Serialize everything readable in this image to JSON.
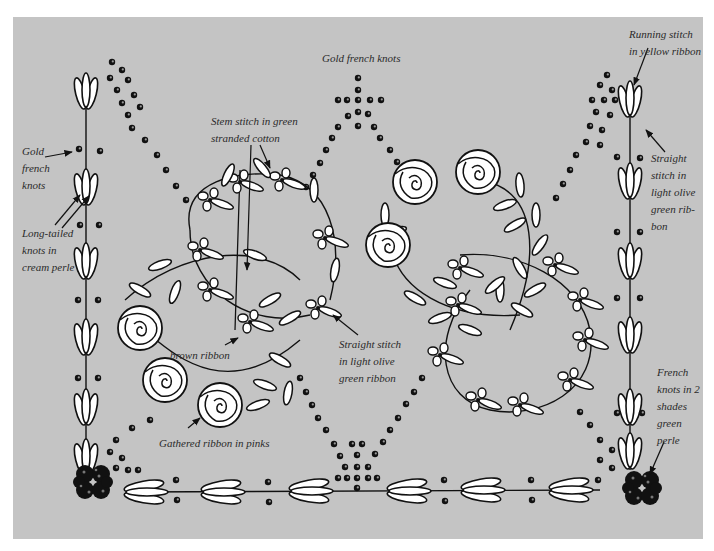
{
  "diagram": {
    "background_color": "#c4c4c4",
    "ink_color": "#111111",
    "fill_color": "#ffffff",
    "labels": {
      "gold_french_knots_left": "Gold\nfrench\nknots",
      "long_tailed_knots": "Long-tailed\nknots in\ncream perle",
      "gold_french_knots_top": "Gold french knots",
      "stem_stitch": "Stem stitch in green\nstranded cotton",
      "brown_ribbon": "brown ribbon",
      "gathered_ribbon": "Gathered ribbon in pinks",
      "straight_stitch_center": "Straight stitch\nin light olive\ngreen ribbon",
      "running_stitch": "Running stitch\nin yellow ribbon",
      "straight_stitch_right": "Straight\nstitch in\nlight olive\ngreen rib-\nbon",
      "french_knots_green": "French\nknots in 2\nshades\ngreen\nperle"
    }
  }
}
